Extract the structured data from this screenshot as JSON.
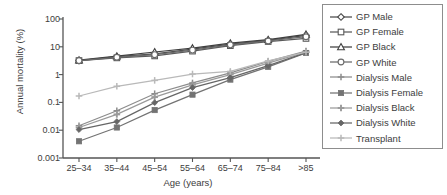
{
  "chart_data": {
    "type": "line",
    "title": "",
    "xlabel": "Age (years)",
    "ylabel": "Annual mortality (%)",
    "categories": [
      "25–34",
      "35–44",
      "45–54",
      "55–64",
      "65–74",
      "75–84",
      ">85"
    ],
    "yscale": "log",
    "ylim": [
      0.001,
      100
    ],
    "yticks": [
      "100",
      "10",
      "1",
      "0.1",
      "0.01",
      "0.001"
    ],
    "ytick_values": [
      100,
      10,
      1,
      0.1,
      0.01,
      0.001
    ],
    "grid": false,
    "legend_position": "right",
    "series": [
      {
        "name": "GP Male",
        "marker": "diamond-open",
        "color": "#4a4a4a",
        "values": [
          3.2,
          4.4,
          5.6,
          8.2,
          12.5,
          17.0,
          26.0
        ]
      },
      {
        "name": "GP Female",
        "marker": "square-open",
        "color": "#5a5a5a",
        "values": [
          3.2,
          4.0,
          4.7,
          7.0,
          11.0,
          15.5,
          20.0
        ]
      },
      {
        "name": "GP Black",
        "marker": "triangle-open",
        "color": "#3f3f3f",
        "values": [
          3.3,
          4.6,
          6.5,
          9.0,
          13.5,
          18.0,
          28.0
        ]
      },
      {
        "name": "GP White",
        "marker": "circle-open",
        "color": "#6a6a6a",
        "values": [
          3.2,
          4.2,
          5.2,
          7.6,
          11.8,
          16.2,
          23.0
        ]
      },
      {
        "name": "Dialysis Male",
        "marker": "plus",
        "color": "#8c8c8c",
        "values": [
          0.0145,
          0.05,
          0.205,
          0.5,
          1.15,
          3.0,
          7.0
        ]
      },
      {
        "name": "Dialysis Female",
        "marker": "square-filled",
        "color": "#737373",
        "values": [
          0.004,
          0.0125,
          0.053,
          0.19,
          0.66,
          1.9,
          6.0
        ]
      },
      {
        "name": "Dialysis Black",
        "marker": "plus-thick",
        "color": "#9a9a9a",
        "values": [
          0.0125,
          0.037,
          0.155,
          0.43,
          1.0,
          2.6,
          6.6
        ]
      },
      {
        "name": "Dialysis White",
        "marker": "diamond-filled",
        "color": "#666666",
        "values": [
          0.0105,
          0.0205,
          0.098,
          0.34,
          0.78,
          2.1,
          6.2
        ]
      },
      {
        "name": "Transplant",
        "marker": "plus-light",
        "color": "#b9b9b9",
        "values": [
          0.17,
          0.38,
          0.62,
          1.05,
          1.3,
          3.1,
          6.4
        ]
      }
    ]
  },
  "axis": {
    "color": "#555555"
  }
}
